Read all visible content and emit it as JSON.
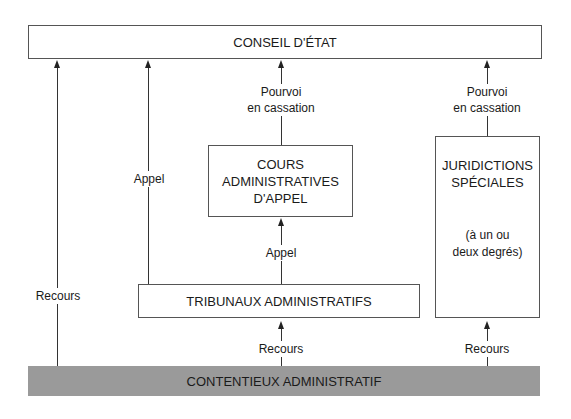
{
  "nodes": {
    "conseil": "CONSEIL D'ÉTAT",
    "caa": [
      "COURS",
      "ADMINISTRATIVES",
      "D'APPEL"
    ],
    "js": [
      "JURIDICTIONS",
      "SPÉCIALES"
    ],
    "js_note": [
      "(à un ou",
      "deux degrés)"
    ],
    "ta": "TRIBUNAUX ADMINISTRATIFS",
    "contentieux": "CONTENTIEUX ADMINISTRATIF"
  },
  "edges": {
    "recours_left": "Recours",
    "appel_left": "Appel",
    "pourvoi_caa": [
      "Pourvoi",
      "en cassation"
    ],
    "pourvoi_js": [
      "Pourvoi",
      "en cassation"
    ],
    "appel_center": "Appel",
    "recours_ta": "Recours",
    "recours_js": "Recours"
  }
}
